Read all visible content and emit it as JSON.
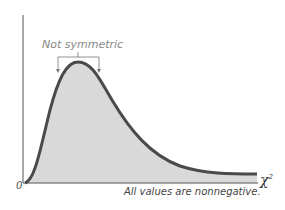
{
  "diagram": {
    "annotation_top": "Not symmetric",
    "origin_label": "0",
    "x_axis_label": "χ",
    "x_axis_superscript": "2",
    "annotation_bottom": "All values are nonnegative.",
    "colors": {
      "curve": "#4a4a4a",
      "fill": "#d9d9d9",
      "axis": "#555555",
      "bracket": "#777777"
    }
  }
}
